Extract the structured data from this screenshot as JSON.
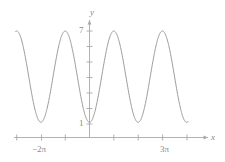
{
  "figure": {
    "name": "cosine-curve-plot",
    "background_color": "#ffffff",
    "curve_color": "#9a9a9a",
    "axis_color": "#a8a8a8",
    "label_color": "#8a8a8a"
  },
  "axes": {
    "y_axis_label": "y",
    "x_axis_label": "x",
    "y_tick_labels": [
      "7",
      "1"
    ],
    "x_tick_labels": [
      "−2π",
      "3π"
    ]
  },
  "chart_data": {
    "type": "line",
    "title": "",
    "xlabel": "x",
    "ylabel": "y",
    "grid": false,
    "legend": null,
    "function": "y = 4 − 3cos(x)",
    "amplitude": 3,
    "midline": 4,
    "period": "2π",
    "minimum_value": 1,
    "maximum_value": 7,
    "xlim": [
      "−3π",
      "4π"
    ],
    "ylim": [
      0,
      8
    ],
    "x_ticks": [
      "−3π",
      "−2π",
      "−π",
      "0",
      "π",
      "2π",
      "3π",
      "4π"
    ],
    "x_tick_labeled": [
      "−2π",
      "3π"
    ],
    "y_ticks": [
      1,
      2,
      3,
      4,
      5,
      6,
      7
    ],
    "y_tick_labeled": [
      1,
      7
    ],
    "minima_at": [
      "−2π",
      "0",
      "2π",
      "4π"
    ],
    "maxima_at": [
      "−3π",
      "−π",
      "π",
      "3π"
    ],
    "x": [
      -9.4248,
      -8.9,
      -8.4,
      -7.9,
      -7.4,
      -6.9,
      -6.4,
      -5.9,
      -5.4,
      -4.9,
      -4.4,
      -3.9,
      -3.4,
      -2.9,
      -2.4,
      -1.9,
      -1.4,
      -0.9,
      -0.4,
      0,
      0.4,
      0.9,
      1.4,
      1.9,
      2.4,
      2.9,
      3.4,
      3.9,
      4.4,
      4.9,
      5.4,
      5.9,
      6.4,
      6.9,
      7.4,
      7.9,
      8.4,
      8.9,
      9.4248,
      10.0,
      10.6,
      11.2,
      11.8,
      12.4,
      12.9
    ],
    "y": [
      7.0,
      6.74,
      6.0,
      4.96,
      3.78,
      2.66,
      1.78,
      1.22,
      1.03,
      1.22,
      1.78,
      2.66,
      3.78,
      4.96,
      6.0,
      6.74,
      7.0,
      5.87,
      1.24,
      1.0,
      1.24,
      2.14,
      3.49,
      4.98,
      6.21,
      6.92,
      6.89,
      6.13,
      4.87,
      3.45,
      2.1,
      1.22,
      1.0,
      1.37,
      2.42,
      3.78,
      5.18,
      6.32,
      7.0,
      6.47,
      5.2,
      3.6,
      2.17,
      1.25,
      1.07
    ]
  }
}
